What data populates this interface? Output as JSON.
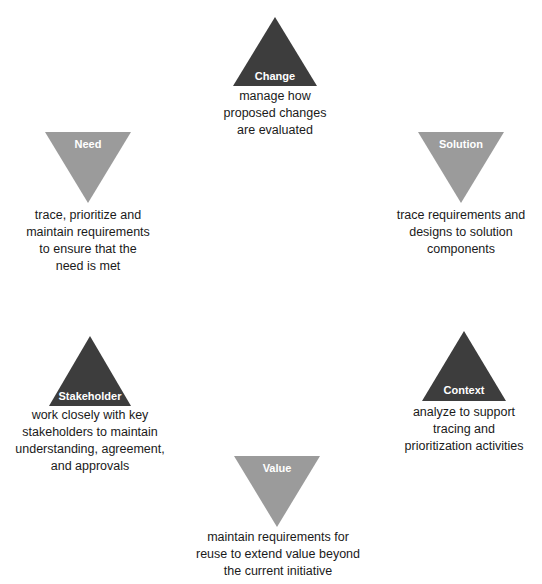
{
  "diagram": {
    "colors": {
      "dark": "#3d3d3d",
      "light": "#9b9b9b",
      "text": "#1a1a1a",
      "label": "#ffffff"
    },
    "nodes": [
      {
        "id": "change",
        "label": "Change",
        "orientation": "up",
        "shade": "dark",
        "description": [
          "manage how",
          "proposed changes",
          "are evaluated"
        ]
      },
      {
        "id": "need",
        "label": "Need",
        "orientation": "down",
        "shade": "light",
        "description": [
          "trace, prioritize and",
          "maintain requirements",
          "to ensure that the",
          "need is met"
        ]
      },
      {
        "id": "solution",
        "label": "Solution",
        "orientation": "down",
        "shade": "light",
        "description": [
          "trace requirements and",
          "designs to solution",
          "components"
        ]
      },
      {
        "id": "stakeholder",
        "label": "Stakeholder",
        "orientation": "up",
        "shade": "dark",
        "description": [
          "work closely with key",
          "stakeholders to maintain",
          "understanding, agreement,",
          "and approvals"
        ]
      },
      {
        "id": "context",
        "label": "Context",
        "orientation": "up",
        "shade": "dark",
        "description": [
          "analyze to support",
          "tracing and",
          "prioritization activities"
        ]
      },
      {
        "id": "value",
        "label": "Value",
        "orientation": "down",
        "shade": "light",
        "description": [
          "maintain requirements for",
          "reuse to extend value beyond",
          "the current initiative"
        ]
      }
    ]
  }
}
